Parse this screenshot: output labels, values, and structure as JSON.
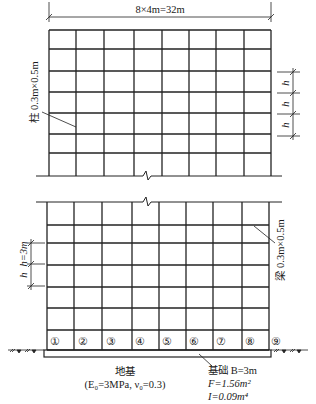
{
  "diagram": {
    "title_dimension": "8×4m=32m",
    "column_label": "柱 0.3m×0.5m",
    "beam_label": "梁 0.3m×0.5m",
    "story_height_label": "h=3m",
    "story_height_symbol": "h",
    "right_dim_labels": [
      "h",
      "h",
      "h"
    ],
    "left_dim_labels": [
      "h=3m",
      "h"
    ],
    "bays": 8,
    "bay_width": "4m",
    "column_numbers": [
      "①",
      "②",
      "③",
      "④",
      "⑤",
      "⑥",
      "⑦",
      "⑧",
      "⑨"
    ],
    "foundation": {
      "label": "基础 B=3m",
      "F": "F=1.56m²",
      "I": "I=0.09m⁴"
    },
    "subgrade": {
      "label": "地基",
      "params": "(E₀=3MPa, ν₀=0.3)"
    }
  }
}
